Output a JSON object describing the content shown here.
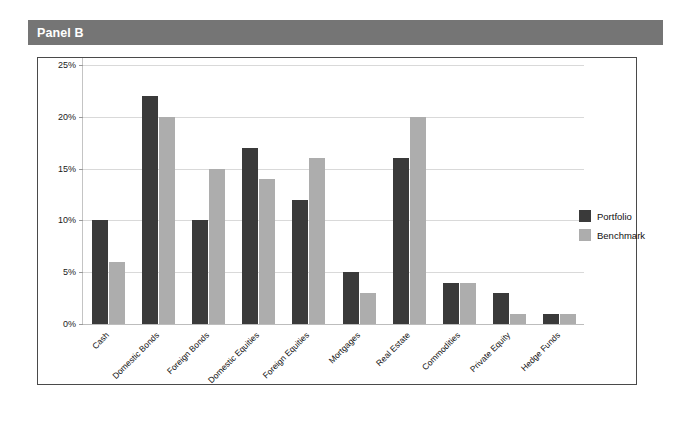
{
  "panel": {
    "title": "Panel B",
    "header_color": "#757575",
    "header_text_color": "#ffffff"
  },
  "legend": {
    "position": "right",
    "entries": [
      {
        "label": "Portfolio",
        "color": "#3a3a3a",
        "swatch_name": "portfolio-swatch"
      },
      {
        "label": "Benchmark",
        "color": "#adadad",
        "swatch_name": "benchmark-swatch"
      }
    ]
  },
  "axis": {
    "y_ticks": [
      "0%",
      "5%",
      "10%",
      "15%",
      "20%",
      "25%"
    ]
  },
  "chart_data": {
    "type": "bar",
    "title": "Panel B",
    "xlabel": "",
    "ylabel": "",
    "ylim": [
      0,
      25
    ],
    "ytick_values": [
      0,
      5,
      10,
      15,
      20,
      25
    ],
    "ytick_labels": [
      "0%",
      "5%",
      "10%",
      "15%",
      "20%",
      "25%"
    ],
    "grid": true,
    "legend_position": "right",
    "categories": [
      "Cash",
      "Domestic Bonds",
      "Foreign Bonds",
      "Domestic Equities",
      "Foreign Equities",
      "Mortgages",
      "Real Estate",
      "Commodities",
      "Private Equity",
      "Hedge Funds"
    ],
    "series": [
      {
        "name": "Portfolio",
        "color": "#3a3a3a",
        "values": [
          10,
          22,
          10,
          17,
          12,
          5,
          16,
          4,
          3,
          1
        ]
      },
      {
        "name": "Benchmark",
        "color": "#adadad",
        "values": [
          6,
          20,
          15,
          14,
          16,
          3,
          20,
          4,
          1,
          1
        ]
      }
    ]
  }
}
